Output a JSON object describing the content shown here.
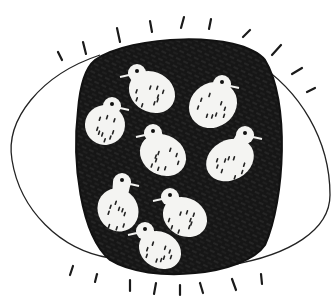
{
  "illustration": {
    "subject": "hand-drawn eye with dark scribbled iris containing birds",
    "colors": {
      "background": "#ffffff",
      "ink": "#141414",
      "bird_fill": "#f4f4f2"
    },
    "bird_count": 8,
    "birds": [
      {
        "cx": 152,
        "cy": 92,
        "rx": 24,
        "ry": 20,
        "rot": 30,
        "head": [
          137,
          71
        ],
        "beak_dir": "left"
      },
      {
        "cx": 213,
        "cy": 105,
        "rx": 25,
        "ry": 22,
        "rot": -35,
        "head": [
          222,
          82
        ],
        "beak_dir": "right"
      },
      {
        "cx": 105,
        "cy": 125,
        "rx": 20,
        "ry": 20,
        "rot": -30,
        "head": [
          112,
          104
        ],
        "beak_dir": "right"
      },
      {
        "cx": 163,
        "cy": 155,
        "rx": 24,
        "ry": 20,
        "rot": 30,
        "head": [
          153,
          131
        ],
        "beak_dir": "left"
      },
      {
        "cx": 230,
        "cy": 160,
        "rx": 25,
        "ry": 20,
        "rot": -30,
        "head": [
          245,
          133
        ],
        "beak_dir": "right"
      },
      {
        "cx": 118,
        "cy": 210,
        "rx": 20,
        "ry": 22,
        "rot": -30,
        "head": [
          122,
          180
        ],
        "beak_dir": "right"
      },
      {
        "cx": 185,
        "cy": 217,
        "rx": 23,
        "ry": 19,
        "rot": 30,
        "head": [
          170,
          195
        ],
        "beak_dir": "left"
      },
      {
        "cx": 160,
        "cy": 250,
        "rx": 22,
        "ry": 18,
        "rot": 30,
        "head": [
          145,
          229
        ],
        "beak_dir": "left"
      }
    ]
  }
}
